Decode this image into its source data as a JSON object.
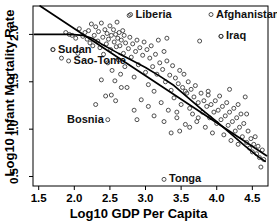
{
  "chart_data": {
    "type": "scatter",
    "title": "",
    "xlabel": "Log10 GDP Per Capita",
    "ylabel": "Log10 Infant Mortality Rate",
    "xlim": [
      1.42,
      4.72
    ],
    "ylim": [
      0.4,
      2.3
    ],
    "xticks": [
      1.5,
      2.0,
      2.5,
      3.0,
      3.5,
      4.0,
      4.5
    ],
    "xtick_labels": [
      "1.5",
      "2.0",
      "2.5",
      "3.0",
      "3.5",
      "4.0",
      "4.5"
    ],
    "yticks": [
      0.5,
      1.0,
      1.5,
      2.0
    ],
    "ytick_labels": [
      "0.5",
      "1.0",
      "1.5",
      "2.0"
    ],
    "grid": false,
    "legend": "none",
    "marker": "open-circle",
    "points": [
      [
        1.7,
        1.84
      ],
      [
        1.88,
        2.02
      ],
      [
        1.93,
        2.0
      ],
      [
        1.97,
        1.99
      ],
      [
        2.02,
        1.96
      ],
      [
        1.82,
        1.75
      ],
      [
        2.05,
        1.8
      ],
      [
        2.07,
        2.06
      ],
      [
        2.12,
        1.98
      ],
      [
        2.15,
        2.02
      ],
      [
        2.18,
        1.95
      ],
      [
        2.2,
        2.04
      ],
      [
        2.22,
        1.91
      ],
      [
        2.24,
        2.11
      ],
      [
        2.26,
        1.88
      ],
      [
        2.28,
        1.99
      ],
      [
        2.3,
        2.08
      ],
      [
        2.33,
        1.93
      ],
      [
        2.34,
        2.03
      ],
      [
        2.36,
        1.86
      ],
      [
        2.38,
        2.12
      ],
      [
        2.4,
        1.97
      ],
      [
        2.41,
        1.79
      ],
      [
        2.43,
        2.05
      ],
      [
        2.44,
        1.35
      ],
      [
        2.45,
        1.9
      ],
      [
        2.46,
        2.01
      ],
      [
        2.47,
        1.7
      ],
      [
        2.48,
        1.95
      ],
      [
        2.5,
        2.09
      ],
      [
        2.51,
        1.84
      ],
      [
        2.52,
        1.99
      ],
      [
        2.53,
        1.62
      ],
      [
        2.55,
        2.05
      ],
      [
        2.56,
        1.92
      ],
      [
        2.57,
        1.51
      ],
      [
        2.58,
        2.0
      ],
      [
        2.59,
        1.87
      ],
      [
        2.6,
        2.13
      ],
      [
        2.61,
        1.96
      ],
      [
        2.62,
        1.73
      ],
      [
        2.63,
        2.02
      ],
      [
        2.64,
        1.88
      ],
      [
        2.65,
        1.58
      ],
      [
        2.66,
        1.94
      ],
      [
        2.68,
        2.04
      ],
      [
        2.69,
        1.8
      ],
      [
        2.7,
        1.99
      ],
      [
        2.71,
        1.66
      ],
      [
        2.72,
        1.91
      ],
      [
        2.74,
        1.44
      ],
      [
        2.76,
        1.85
      ],
      [
        2.77,
        2.2
      ],
      [
        2.78,
        1.97
      ],
      [
        2.8,
        1.76
      ],
      [
        2.82,
        1.9
      ],
      [
        2.84,
        1.55
      ],
      [
        2.86,
        1.82
      ],
      [
        2.88,
        1.94
      ],
      [
        2.9,
        1.68
      ],
      [
        2.92,
        1.86
      ],
      [
        2.94,
        1.31
      ],
      [
        2.96,
        1.78
      ],
      [
        2.98,
        1.92
      ],
      [
        3.0,
        1.6
      ],
      [
        3.02,
        1.84
      ],
      [
        3.04,
        1.47
      ],
      [
        3.06,
        1.75
      ],
      [
        3.08,
        1.88
      ],
      [
        3.1,
        1.66
      ],
      [
        3.12,
        1.4
      ],
      [
        3.14,
        1.79
      ],
      [
        3.16,
        1.58
      ],
      [
        3.18,
        1.94
      ],
      [
        3.2,
        1.7
      ],
      [
        3.22,
        1.28
      ],
      [
        3.24,
        1.63
      ],
      [
        3.26,
        1.82
      ],
      [
        3.28,
        1.5
      ],
      [
        3.3,
        1.72
      ],
      [
        3.32,
        1.2
      ],
      [
        3.34,
        1.57
      ],
      [
        3.36,
        1.41
      ],
      [
        3.38,
        1.67
      ],
      [
        3.4,
        1.33
      ],
      [
        3.42,
        1.54
      ],
      [
        3.44,
        1.12
      ],
      [
        3.46,
        1.48
      ],
      [
        3.48,
        1.62
      ],
      [
        3.5,
        1.26
      ],
      [
        3.52,
        1.44
      ],
      [
        3.54,
        1.58
      ],
      [
        3.56,
        1.05
      ],
      [
        3.58,
        1.38
      ],
      [
        3.6,
        1.5
      ],
      [
        3.62,
        1.22
      ],
      [
        3.64,
        1.42
      ],
      [
        3.66,
        1.16
      ],
      [
        3.68,
        1.34
      ],
      [
        3.7,
        1.46
      ],
      [
        3.72,
        1.08
      ],
      [
        3.74,
        1.28
      ],
      [
        3.76,
        1.93
      ],
      [
        3.78,
        1.38
      ],
      [
        3.8,
        1.18
      ],
      [
        3.82,
        1.3
      ],
      [
        3.84,
        1.02
      ],
      [
        3.86,
        1.24
      ],
      [
        3.88,
        1.36
      ],
      [
        3.9,
        1.12
      ],
      [
        3.92,
        1.26
      ],
      [
        3.94,
        0.96
      ],
      [
        3.96,
        1.18
      ],
      [
        3.98,
        1.3
      ],
      [
        4.0,
        1.06
      ],
      [
        4.02,
        1.2
      ],
      [
        4.04,
        1.35
      ],
      [
        4.06,
        1.1
      ],
      [
        4.08,
        1.24
      ],
      [
        4.1,
        0.94
      ],
      [
        4.12,
        1.14
      ],
      [
        4.14,
        1.28
      ],
      [
        4.16,
        1.04
      ],
      [
        4.18,
        1.18
      ],
      [
        4.2,
        0.88
      ],
      [
        4.22,
        1.08
      ],
      [
        4.24,
        1.22
      ],
      [
        4.26,
        0.98
      ],
      [
        4.28,
        1.12
      ],
      [
        4.3,
        0.84
      ],
      [
        4.32,
        1.02
      ],
      [
        4.34,
        1.16
      ],
      [
        4.36,
        0.92
      ],
      [
        4.38,
        1.06
      ],
      [
        4.4,
        1.34
      ],
      [
        4.42,
        0.86
      ],
      [
        4.44,
        0.98
      ],
      [
        4.46,
        0.8
      ],
      [
        4.48,
        0.9
      ],
      [
        4.5,
        0.76
      ],
      [
        4.52,
        0.84
      ],
      [
        4.54,
        0.92
      ],
      [
        4.56,
        0.74
      ],
      [
        4.58,
        0.82
      ],
      [
        4.6,
        0.7
      ],
      [
        4.62,
        0.6
      ],
      [
        4.64,
        0.78
      ],
      [
        4.66,
        0.68
      ],
      [
        2.3,
        1.26
      ],
      [
        2.52,
        1.36
      ],
      [
        3.3,
        1.96
      ],
      [
        3.56,
        1.4
      ],
      [
        3.74,
        1.12
      ],
      [
        4.06,
        1.98
      ],
      [
        2.88,
        1.1
      ],
      [
        3.12,
        1.14
      ],
      [
        3.36,
        0.96
      ],
      [
        3.44,
        1.18
      ],
      [
        3.62,
        1.02
      ],
      [
        3.88,
        1.4
      ],
      [
        2.66,
        1.44
      ],
      [
        2.84,
        1.2
      ],
      [
        3.04,
        1.24
      ],
      [
        3.26,
        1.08
      ],
      [
        3.48,
        0.98
      ],
      [
        4.18,
        1.42
      ],
      [
        4.3,
        1.26
      ],
      [
        4.42,
        1.16
      ],
      [
        2.38,
        1.52
      ],
      [
        2.58,
        1.3
      ]
    ],
    "highlighted_points": [
      {
        "label": "Liberia",
        "x": 2.79,
        "y": 2.21,
        "label_side": "right"
      },
      {
        "label": "Afghanistan",
        "x": 3.92,
        "y": 2.21,
        "label_side": "right"
      },
      {
        "label": "Iraq",
        "x": 4.06,
        "y": 1.98,
        "label_side": "right"
      },
      {
        "label": "Sudan",
        "x": 1.7,
        "y": 1.84,
        "label_side": "right"
      },
      {
        "label": "Sao-Tome",
        "x": 1.92,
        "y": 1.72,
        "label_side": "right"
      },
      {
        "label": "Bosnia",
        "x": 2.47,
        "y": 1.1,
        "label_side": "left"
      },
      {
        "label": "Tonga",
        "x": 3.26,
        "y": 0.47,
        "label_side": "right"
      }
    ],
    "fit_lines": [
      {
        "name": "linear-regression",
        "type": "straight",
        "points": [
          [
            1.52,
            2.3
          ],
          [
            4.7,
            0.72
          ]
        ]
      },
      {
        "name": "lowess-smoother",
        "type": "smooth",
        "points": [
          [
            1.44,
            2.0
          ],
          [
            1.7,
            2.0
          ],
          [
            1.95,
            2.0
          ],
          [
            2.12,
            1.99
          ],
          [
            2.25,
            1.96
          ],
          [
            2.38,
            1.9
          ],
          [
            2.5,
            1.85
          ],
          [
            2.62,
            1.8
          ],
          [
            2.8,
            1.73
          ],
          [
            3.0,
            1.65
          ],
          [
            3.2,
            1.56
          ],
          [
            3.4,
            1.46
          ],
          [
            3.6,
            1.33
          ],
          [
            3.8,
            1.2
          ],
          [
            4.0,
            1.08
          ],
          [
            4.2,
            0.95
          ],
          [
            4.4,
            0.82
          ],
          [
            4.6,
            0.7
          ],
          [
            4.68,
            0.66
          ]
        ]
      }
    ],
    "style": {
      "point_color": "#3b3b3b",
      "line_color": "#000000",
      "axis_color": "#000000",
      "background": "#ffffff"
    }
  }
}
